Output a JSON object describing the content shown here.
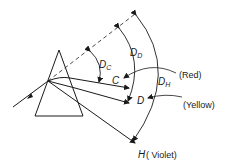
{
  "diagram": {
    "type": "prism-dispersion",
    "labels": {
      "dc_main": "D",
      "dc_sub": "C",
      "dd_main": "D",
      "dd_sub": "D",
      "dh_main": "D",
      "dh_sub": "H",
      "ray_c": "C",
      "ray_d": "D",
      "ray_h": "H",
      "red": "(Red)",
      "yellow": "(Yellow)",
      "violet": "( Violet)"
    },
    "colors": {
      "ink": "#1a1a1a",
      "background": "#ffffff"
    }
  }
}
